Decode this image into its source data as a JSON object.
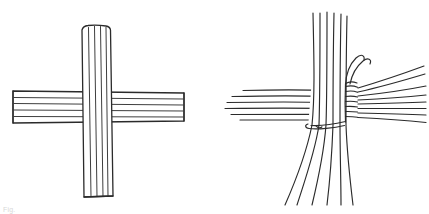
{
  "figure": {
    "background_color": "#ffffff",
    "stroke_color": "#2b2b2b",
    "faint_color": "#8d8d8d",
    "width": 429,
    "height": 214,
    "panel_count": 2,
    "caption_fragment": "Fig."
  },
  "panels": [
    {
      "id": "panel-left",
      "name": "flat-cross-bundles",
      "label": "Two flat bundles crossed at right angles",
      "origin_x": 0,
      "origin_y": 0,
      "width": 215,
      "height": 214,
      "vertical_bundle": {
        "name": "vertical-bundle",
        "strand_count": 5,
        "top_y": 25,
        "bottom_y": 197,
        "center_x": 96,
        "width_top": 28,
        "width_bottom": 30,
        "end_style": "blunt-cut",
        "over_under": "over"
      },
      "horizontal_bundle": {
        "name": "horizontal-bundle",
        "strand_count": 5,
        "left_x": 11,
        "right_x": 184,
        "center_y": 106,
        "height_left": 32,
        "height_right": 30,
        "end_style": "blunt-cut",
        "over_under": "under"
      }
    },
    {
      "id": "panel-right",
      "name": "lashed-joint-separated-strands",
      "label": "Strands separated and bound with cord",
      "origin_x": 215,
      "origin_y": 0,
      "width": 214,
      "height": 214,
      "vertical_strands": {
        "name": "vertical-strands",
        "count": 6,
        "top_y": 12,
        "bottom_y": 205,
        "center_x": 328,
        "spread_top": 30,
        "spread_bottom": 40,
        "end_style": "open-splayed"
      },
      "horizontal_strands_left": {
        "name": "horizontal-strands-left",
        "count": 6,
        "left_x": 220,
        "center_y": 103,
        "spread": 26,
        "end_style": "open-splayed"
      },
      "horizontal_strands_right": {
        "name": "horizontal-strands-right",
        "count": 8,
        "right_x": 425,
        "center_y": 100,
        "spread": 34,
        "end_style": "fanned-out"
      },
      "binding": {
        "name": "binding-cord",
        "wrap_count": 7,
        "x": 344,
        "top_y": 82,
        "bottom_y": 122,
        "loose_end_count": 2,
        "loose_end_shape": "hooked-up",
        "bottom_wrap_y": 124,
        "description": "Cord wrapped around vertical strand group, two loose ends curving upward"
      }
    }
  ]
}
